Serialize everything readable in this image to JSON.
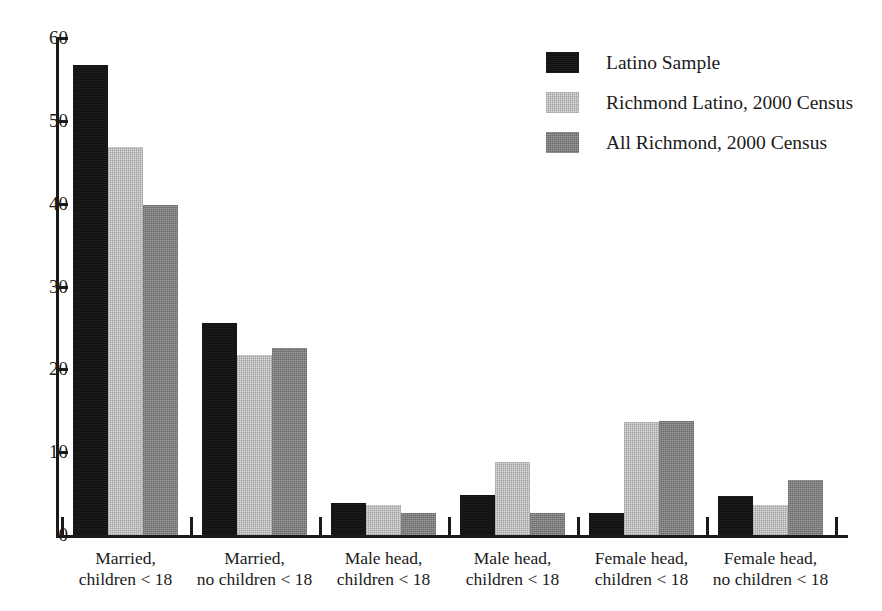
{
  "chart_data": {
    "type": "bar",
    "title": "",
    "subtitle": "",
    "xlabel": "",
    "ylabel": "",
    "ylim": [
      0,
      60
    ],
    "yticks": [
      0,
      10,
      20,
      30,
      40,
      50,
      60
    ],
    "ytick_labels": [
      "0",
      "10",
      "20",
      "30",
      "40",
      "50",
      "60"
    ],
    "grid": false,
    "legend_position": "top-right",
    "categories": [
      "Married, children < 18",
      "Married, no children < 18",
      "Male head, children < 18",
      "Male head, children < 18",
      "Female head, children < 18",
      "Female head, no children < 18"
    ],
    "category_lines": [
      [
        "Married,",
        "children < 18"
      ],
      [
        "Married,",
        "no children < 18"
      ],
      [
        "Male head,",
        "children < 18"
      ],
      [
        "Male head,",
        "children < 18"
      ],
      [
        "Female head,",
        "children < 18"
      ],
      [
        "Female head,",
        "no children < 18"
      ]
    ],
    "series": [
      {
        "name": "Latino Sample",
        "color": "#111111",
        "values": [
          56.8,
          25.6,
          3.9,
          4.8,
          2.7,
          4.7
        ]
      },
      {
        "name": "Richmond Latino, 2000 Census",
        "color": "#dcdcdc",
        "values": [
          46.8,
          21.7,
          3.6,
          8.8,
          13.6,
          3.6
        ]
      },
      {
        "name": "All Richmond, 2000 Census",
        "color": "#7d7d7d",
        "values": [
          39.8,
          22.6,
          2.7,
          2.7,
          13.8,
          6.7
        ]
      }
    ]
  },
  "legend": {
    "entries": [
      {
        "label": "Latino Sample",
        "color": "#111111"
      },
      {
        "label": "Richmond Latino, 2000 Census",
        "color": "#dcdcdc"
      },
      {
        "label": "All Richmond, 2000 Census",
        "color": "#7d7d7d"
      }
    ]
  }
}
